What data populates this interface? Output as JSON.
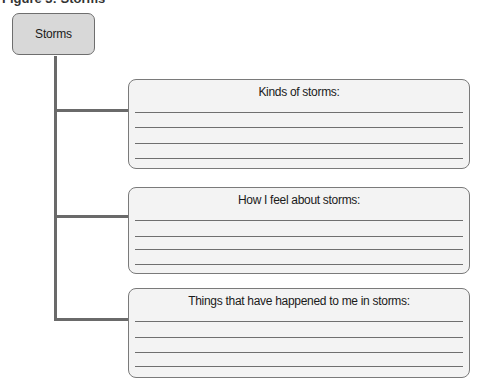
{
  "heading": {
    "text": "Figure 3: Storms"
  },
  "root": {
    "label": "Storms"
  },
  "sections": [
    {
      "title": "Kinds of storms:",
      "lines": 4
    },
    {
      "title": "How I feel about storms:",
      "lines": 4
    },
    {
      "title": "Things that have happened to me in storms:",
      "lines": 4
    }
  ],
  "colors": {
    "root_fill": "#d8d8d8",
    "box_fill": "#f3f3f3",
    "border": "#7a7a7a",
    "connector": "#6a6a6a"
  }
}
